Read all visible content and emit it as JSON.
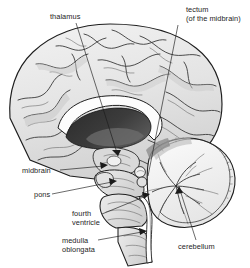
{
  "figure": {
    "type": "anatomical-illustration",
    "style": "grayscale line drawing with shading",
    "background_color": "#ffffff",
    "ink_color": "#1e1e1e"
  },
  "labels": {
    "thalamus": {
      "text": "thalamus",
      "lines": [
        "thalamus"
      ]
    },
    "tectum_line1": {
      "text": "tectum"
    },
    "tectum_line2": {
      "text": "(of the midbrain)"
    },
    "midbrain": {
      "text": "midbrain"
    },
    "pons": {
      "text": "pons"
    },
    "fourth_ventricle_line1": {
      "text": "fourth"
    },
    "fourth_ventricle_line2": {
      "text": "ventricle"
    },
    "medulla_line1": {
      "text": "medulla"
    },
    "medulla_line2": {
      "text": "oblongata"
    },
    "cerebellum": {
      "text": "cerebellum"
    }
  },
  "structures": [
    {
      "name": "cerebral-cortex",
      "shading": "light-gray"
    },
    {
      "name": "corpus-callosum",
      "shading": "white"
    },
    {
      "name": "lateral-ventricle",
      "shading": "dark-gray-black"
    },
    {
      "name": "thalamus",
      "shading": "mid-gray"
    },
    {
      "name": "midbrain",
      "shading": "mid-gray"
    },
    {
      "name": "pons",
      "shading": "light-gray"
    },
    {
      "name": "medulla-oblongata",
      "shading": "light-gray"
    },
    {
      "name": "fourth-ventricle",
      "shading": "white"
    },
    {
      "name": "cerebellum",
      "shading": "white-with-arbor-vitae"
    },
    {
      "name": "tectum",
      "shading": "mid-gray"
    }
  ]
}
